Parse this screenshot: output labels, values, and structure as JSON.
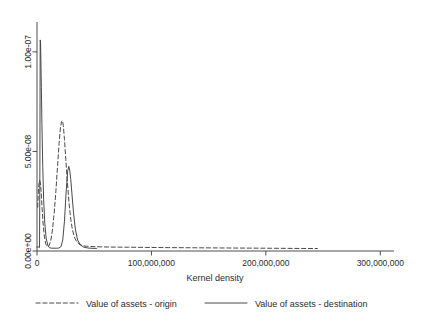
{
  "chart_data": {
    "type": "line",
    "title": "",
    "subtitle": "",
    "xlabel": "Kernel density",
    "ylabel": "",
    "xlim": [
      0,
      312000000
    ],
    "ylim": [
      0,
      1.15e-07
    ],
    "grid": false,
    "legend_position": "bottom",
    "xticks": [
      0,
      100000000,
      200000000,
      300000000
    ],
    "xtick_labels": [
      "0",
      "100,000,000",
      "200,000,000",
      "300,000,000"
    ],
    "yticks": [
      0,
      5e-08,
      1e-07
    ],
    "ytick_labels": [
      "0.00e+00",
      "5.00e-08",
      "1.00e-07"
    ],
    "series": [
      {
        "name": "Value of assets - origin",
        "style": "dashed",
        "color": "#3f3f3f",
        "x": [
          600000,
          1400000,
          2200000,
          2900000,
          3600000,
          4400000,
          5300000,
          6400000,
          7600000,
          9000000,
          10500000,
          12000000,
          13500000,
          15000000,
          16500000,
          18000000,
          19300000,
          20500000,
          21400000,
          22200000,
          23000000,
          24000000,
          25200000,
          26500000,
          28000000,
          29500000,
          31000000,
          33000000,
          35000000,
          37500000,
          40000000,
          43000000,
          46000000,
          50000000,
          55000000,
          62000000,
          70000000,
          80000000,
          95000000,
          115000000,
          140000000,
          170000000,
          200000000,
          225000000,
          245000000
        ],
        "y": [
          2.2e-08,
          3.2e-08,
          3.55e-08,
          3.45e-08,
          3e-08,
          2.2e-08,
          1.4e-08,
          7.5e-09,
          3.6e-09,
          2.2e-09,
          2.6e-09,
          5e-09,
          1.05e-08,
          1.9e-08,
          3e-08,
          4.3e-08,
          5.4e-08,
          6.2e-08,
          6.5e-08,
          6.55e-08,
          6.3e-08,
          5.6e-08,
          4.6e-08,
          3.5e-08,
          2.4e-08,
          1.6e-08,
          1.05e-08,
          6.5e-09,
          4.4e-09,
          3.2e-09,
          2.7e-09,
          2.4e-09,
          2.3e-09,
          2.2e-09,
          2.1e-09,
          2e-09,
          1.95e-09,
          1.9e-09,
          1.8e-09,
          1.7e-09,
          1.6e-09,
          1.5e-09,
          1.4e-09,
          1.3e-09,
          1.25e-09
        ]
      },
      {
        "name": "Value of assets - destination",
        "style": "solid",
        "color": "#3f3f3f",
        "x": [
          2200000,
          2500000,
          2800000,
          3100000,
          3400000,
          3800000,
          4300000,
          5000000,
          5800000,
          6800000,
          8000000,
          9500000,
          11000000,
          13000000,
          15000000,
          17000000,
          19000000,
          21000000,
          22500000,
          24000000,
          25500000,
          26800000,
          27800000,
          28600000,
          29500000,
          30500000,
          31800000,
          33500000,
          35500000,
          38000000,
          41000000,
          44500000,
          48000000,
          52000000
        ],
        "y": [
          2e-09,
          4e-08,
          1.06e-07,
          1.05e-07,
          9.6e-08,
          8.2e-08,
          6.4e-08,
          4.3e-08,
          2.6e-08,
          1.4e-08,
          6.5e-09,
          2.8e-09,
          1.6e-09,
          1.4e-09,
          1.4e-09,
          1.4e-09,
          1.45e-09,
          2.2e-09,
          5.5e-09,
          1.5e-08,
          3e-08,
          4e-08,
          4.25e-08,
          4.05e-08,
          3.6e-08,
          2.9e-08,
          2e-08,
          1.1e-08,
          5.5e-09,
          3e-09,
          1.9e-09,
          1.5e-09,
          1.35e-09,
          1.3e-09
        ]
      }
    ],
    "legend": [
      {
        "label": "Value of assets - origin",
        "style": "dashed"
      },
      {
        "label": "Value of assets - destination",
        "style": "solid"
      }
    ]
  }
}
